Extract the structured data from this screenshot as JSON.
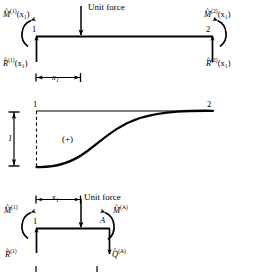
{
  "figure": {
    "title_text": "",
    "panels": [
      {
        "id": "panel-beam-reactions",
        "unit_force_label": "Unit force",
        "node_left_label": "1",
        "node_right_label": "2",
        "moment_left": {
          "symbol": "M",
          "hat": "^",
          "superscript": "(1)",
          "argument": "(x₁)"
        },
        "moment_right": {
          "symbol": "M",
          "hat": "^",
          "superscript": "(2)",
          "argument": "(x₁)"
        },
        "reaction_left": {
          "symbol": "R",
          "hat": "^",
          "superscript": "(1)",
          "argument": "(x₁)"
        },
        "reaction_right": {
          "symbol": "R",
          "hat": "^",
          "superscript": "(2)",
          "argument": "(x₁)"
        },
        "dimension_label": "x₁"
      },
      {
        "id": "panel-influence-line",
        "node_left_label": "1",
        "node_right_label": "2",
        "ordinate_label": "1",
        "sign_label": "(+)"
      },
      {
        "id": "panel-free-body",
        "unit_force_label": "Unit force",
        "node_left_label": "1",
        "cut_point_label": "A",
        "dimension_label": "x₁",
        "moment_left": {
          "symbol": "M",
          "hat": "^",
          "superscript": "(1)",
          "argument": ""
        },
        "moment_cut": {
          "symbol": "M",
          "hat": "^",
          "superscript": "(A)",
          "argument": ""
        },
        "reaction_left": {
          "symbol": "R",
          "hat": "^",
          "superscript": "(1)",
          "argument": ""
        },
        "shear_cut": {
          "symbol": "Q",
          "hat": "^",
          "superscript": "(A)",
          "argument": ""
        }
      }
    ]
  },
  "colors": {
    "ink": "#000000",
    "paper": "#ffffff"
  }
}
